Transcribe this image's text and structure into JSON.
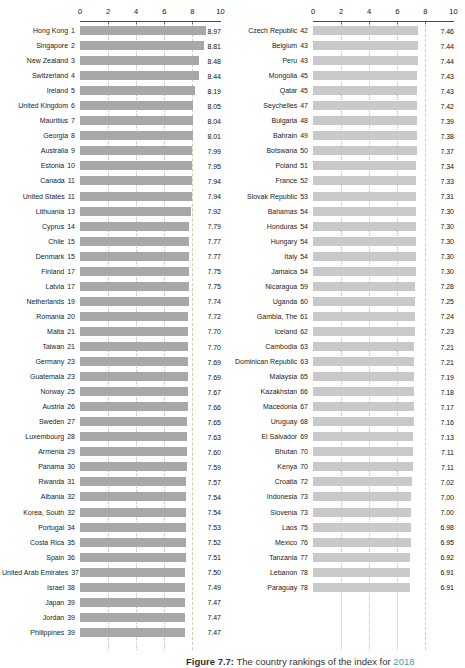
{
  "caption": {
    "fig_label": "Figure 7.7:",
    "text": "The country rankings of the index for",
    "year": "2018"
  },
  "colors": {
    "left_bar": "#a8a8a8",
    "right_bar": "#c9c9c9",
    "gridline": "#bcbcbc",
    "reference_line": "#d4ccae",
    "axis_line": "#4a4a4a"
  },
  "chart_data": {
    "type": "bar",
    "orientation": "horizontal",
    "title": "",
    "xlabel": "",
    "ylabel": "",
    "xlim": [
      0,
      10
    ],
    "x_ticks": [
      "0",
      "2",
      "4",
      "6",
      "8",
      "10"
    ],
    "grid_values": [
      2,
      4,
      6
    ],
    "reference_value": 8,
    "legend": "none",
    "panels": [
      {
        "rows": [
          {
            "label": "Hong Kong",
            "rank": "1",
            "value": "8.97"
          },
          {
            "label": "Singapore",
            "rank": "2",
            "value": "8.81"
          },
          {
            "label": "New Zealand",
            "rank": "3",
            "value": "8.48"
          },
          {
            "label": "Switzerland",
            "rank": "4",
            "value": "8.44"
          },
          {
            "label": "Ireland",
            "rank": "5",
            "value": "8.19"
          },
          {
            "label": "United Kingdom",
            "rank": "6",
            "value": "8.05"
          },
          {
            "label": "Mauritius",
            "rank": "7",
            "value": "8.04"
          },
          {
            "label": "Georgia",
            "rank": "8",
            "value": "8.01"
          },
          {
            "label": "Australia",
            "rank": "9",
            "value": "7.99"
          },
          {
            "label": "Estonia",
            "rank": "10",
            "value": "7.95"
          },
          {
            "label": "Canada",
            "rank": "11",
            "value": "7.94"
          },
          {
            "label": "United States",
            "rank": "11",
            "value": "7.94"
          },
          {
            "label": "Lithuania",
            "rank": "13",
            "value": "7.92"
          },
          {
            "label": "Cyprus",
            "rank": "14",
            "value": "7.79"
          },
          {
            "label": "Chile",
            "rank": "15",
            "value": "7.77"
          },
          {
            "label": "Denmark",
            "rank": "15",
            "value": "7.77"
          },
          {
            "label": "Finland",
            "rank": "17",
            "value": "7.75"
          },
          {
            "label": "Latvia",
            "rank": "17",
            "value": "7.75"
          },
          {
            "label": "Netherlands",
            "rank": "19",
            "value": "7.74"
          },
          {
            "label": "Romania",
            "rank": "20",
            "value": "7.72"
          },
          {
            "label": "Malta",
            "rank": "21",
            "value": "7.70"
          },
          {
            "label": "Taiwan",
            "rank": "21",
            "value": "7.70"
          },
          {
            "label": "Germany",
            "rank": "23",
            "value": "7.69"
          },
          {
            "label": "Guatemala",
            "rank": "23",
            "value": "7.69"
          },
          {
            "label": "Norway",
            "rank": "25",
            "value": "7.67"
          },
          {
            "label": "Austria",
            "rank": "26",
            "value": "7.66"
          },
          {
            "label": "Sweden",
            "rank": "27",
            "value": "7.65"
          },
          {
            "label": "Luxembourg",
            "rank": "28",
            "value": "7.63"
          },
          {
            "label": "Armenia",
            "rank": "29",
            "value": "7.60"
          },
          {
            "label": "Panama",
            "rank": "30",
            "value": "7.59"
          },
          {
            "label": "Rwanda",
            "rank": "31",
            "value": "7.57"
          },
          {
            "label": "Albania",
            "rank": "32",
            "value": "7.54"
          },
          {
            "label": "Korea, South",
            "rank": "32",
            "value": "7.54"
          },
          {
            "label": "Portugal",
            "rank": "34",
            "value": "7.53"
          },
          {
            "label": "Costa Rica",
            "rank": "35",
            "value": "7.52"
          },
          {
            "label": "Spain",
            "rank": "36",
            "value": "7.51"
          },
          {
            "label": "United Arab Emirates",
            "rank": "37",
            "value": "7.50"
          },
          {
            "label": "Israel",
            "rank": "38",
            "value": "7.49"
          },
          {
            "label": "Japan",
            "rank": "39",
            "value": "7.47"
          },
          {
            "label": "Jordan",
            "rank": "39",
            "value": "7.47"
          },
          {
            "label": "Philippines",
            "rank": "39",
            "value": "7.47"
          }
        ]
      },
      {
        "rows": [
          {
            "label": "Czech Republic",
            "rank": "42",
            "value": "7.46"
          },
          {
            "label": "Belgium",
            "rank": "43",
            "value": "7.44"
          },
          {
            "label": "Peru",
            "rank": "43",
            "value": "7.44"
          },
          {
            "label": "Mongolia",
            "rank": "45",
            "value": "7.43"
          },
          {
            "label": "Qatar",
            "rank": "45",
            "value": "7.43"
          },
          {
            "label": "Seychelles",
            "rank": "47",
            "value": "7.42"
          },
          {
            "label": "Bulgaria",
            "rank": "48",
            "value": "7.39"
          },
          {
            "label": "Bahrain",
            "rank": "49",
            "value": "7.38"
          },
          {
            "label": "Botswana",
            "rank": "50",
            "value": "7.37"
          },
          {
            "label": "Poland",
            "rank": "51",
            "value": "7.34"
          },
          {
            "label": "France",
            "rank": "52",
            "value": "7.33"
          },
          {
            "label": "Slovak Republic",
            "rank": "53",
            "value": "7.31"
          },
          {
            "label": "Bahamas",
            "rank": "54",
            "value": "7.30"
          },
          {
            "label": "Honduras",
            "rank": "54",
            "value": "7.30"
          },
          {
            "label": "Hungary",
            "rank": "54",
            "value": "7.30"
          },
          {
            "label": "Italy",
            "rank": "54",
            "value": "7.30"
          },
          {
            "label": "Jamaica",
            "rank": "54",
            "value": "7.30"
          },
          {
            "label": "Nicaragua",
            "rank": "59",
            "value": "7.28"
          },
          {
            "label": "Uganda",
            "rank": "60",
            "value": "7.25"
          },
          {
            "label": "Gambia, The",
            "rank": "61",
            "value": "7.24"
          },
          {
            "label": "Iceland",
            "rank": "62",
            "value": "7.23"
          },
          {
            "label": "Cambodia",
            "rank": "63",
            "value": "7.21"
          },
          {
            "label": "Dominican Republic",
            "rank": "63",
            "value": "7.21"
          },
          {
            "label": "Malaysia",
            "rank": "65",
            "value": "7.19"
          },
          {
            "label": "Kazakhstan",
            "rank": "66",
            "value": "7.18"
          },
          {
            "label": "Macedonia",
            "rank": "67",
            "value": "7.17"
          },
          {
            "label": "Uruguay",
            "rank": "68",
            "value": "7.16"
          },
          {
            "label": "El Salvador",
            "rank": "69",
            "value": "7.13"
          },
          {
            "label": "Bhutan",
            "rank": "70",
            "value": "7.11"
          },
          {
            "label": "Kenya",
            "rank": "70",
            "value": "7.11"
          },
          {
            "label": "Croatia",
            "rank": "72",
            "value": "7.02"
          },
          {
            "label": "Indonesia",
            "rank": "73",
            "value": "7.00"
          },
          {
            "label": "Slovenia",
            "rank": "73",
            "value": "7.00"
          },
          {
            "label": "Laos",
            "rank": "75",
            "value": "6.98"
          },
          {
            "label": "Mexico",
            "rank": "76",
            "value": "6.95"
          },
          {
            "label": "Tanzania",
            "rank": "77",
            "value": "6.92"
          },
          {
            "label": "Lebanon",
            "rank": "78",
            "value": "6.91"
          },
          {
            "label": "Paraguay",
            "rank": "78",
            "value": "6.91"
          }
        ]
      }
    ]
  }
}
